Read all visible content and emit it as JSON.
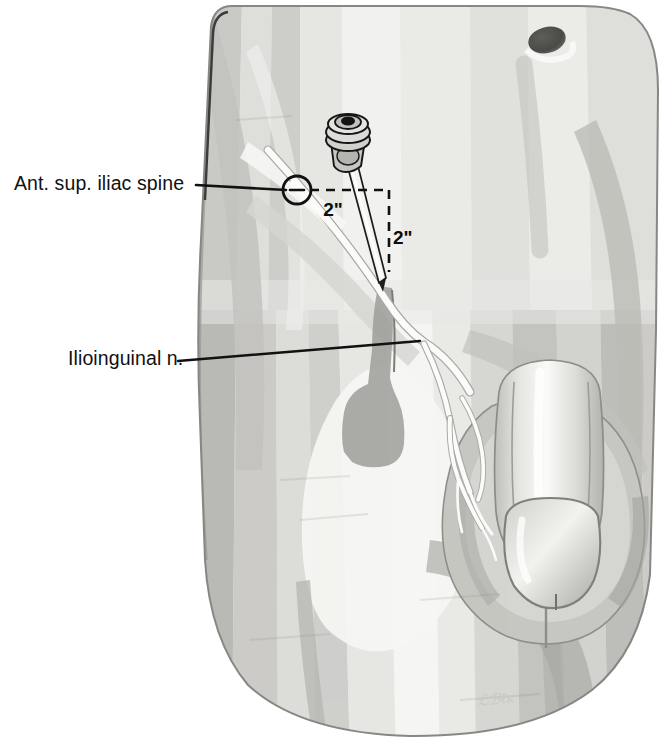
{
  "figure": {
    "kind": "medical-illustration",
    "background_color": "#ffffff",
    "ink_color": "#111111"
  },
  "annotations": [
    {
      "id": "asis",
      "label": "Ant. sup. iliac spine",
      "label_x": 14,
      "label_y": 190,
      "leader": "M 196 185 L 286 190",
      "marker": {
        "cx": 297,
        "cy": 190,
        "r": 14
      }
    },
    {
      "id": "ilioinguinal",
      "label": "Ilioinguinal n.",
      "label_x": 68,
      "label_y": 365,
      "leader": "M 178 361 L 420 341"
    }
  ],
  "dimensions": [
    {
      "id": "dim-horizontal",
      "value": "2\"",
      "text_x": 333,
      "text_y": 216,
      "path": "M 310 190 L 389 190"
    },
    {
      "id": "dim-vertical",
      "value": "2\"",
      "text_x": 393,
      "text_y": 244,
      "path": "M 389 190 L 389 272"
    }
  ],
  "devices": {
    "needle": {
      "name": "block-needle",
      "hub_label": "luer-lock-hub",
      "tip_x": 381,
      "tip_y": 282
    }
  },
  "anatomy": {
    "umbilicus": {
      "cx": 547,
      "cy": 40,
      "rx": 19,
      "ry": 13
    },
    "regions": [
      "lower-abdomen",
      "inguinal-region",
      "scrotum",
      "penis",
      "thigh-left",
      "thigh-right"
    ]
  },
  "credit": {
    "signature": "ℒℬℓĸ"
  },
  "palette": {
    "skin_lightest": "#fbfbfa",
    "skin_light": "#efefed",
    "skin_mid": "#dcdcd9",
    "skin_mid2": "#cdcdc9",
    "skin_dark": "#bcbcb8",
    "skin_darker": "#a9a9a5",
    "shadow": "#9a9a96",
    "outline": "#6f6f6d",
    "ink": "#111111"
  }
}
